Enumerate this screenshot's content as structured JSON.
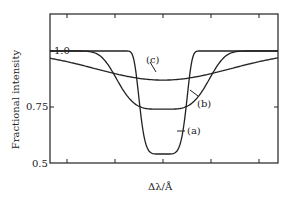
{
  "chart_data": {
    "type": "line",
    "title": "",
    "xlabel": "Δλ/Å",
    "ylabel": "Fractional intensity",
    "yticks": [
      "1.0",
      "0.75",
      "0.5"
    ],
    "ylim": [
      0.5,
      1.15
    ],
    "grid": false,
    "series": [
      {
        "name": "(a)",
        "shape": "narrow deep dip",
        "minimum": 0.54,
        "half_width_rel": 0.11
      },
      {
        "name": "(b)",
        "shape": "medium dip",
        "minimum": 0.74,
        "half_width_rel": 0.22
      },
      {
        "name": "(c)",
        "shape": "broad shallow dip",
        "minimum": 0.87,
        "half_width_rel": 0.42
      }
    ]
  },
  "labels": {
    "a": "(a)",
    "b": "(b)",
    "c": "(c)"
  }
}
